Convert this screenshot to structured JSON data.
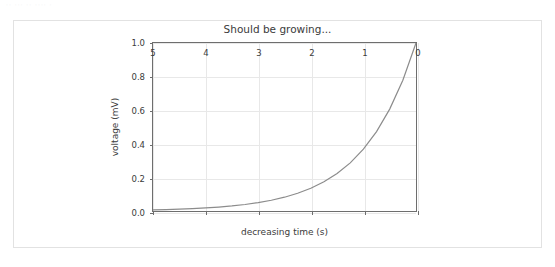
{
  "top_artifact": {
    "ghost_text": "··  ···  ·· ···· ·"
  },
  "card": {
    "border_color": "#e2e2e2",
    "background": "#ffffff"
  },
  "chart_data": {
    "type": "line",
    "title": "Should be growing...",
    "xlabel": "decreasing time (s)",
    "ylabel": "voltage (mV)",
    "xlim": [
      5,
      0
    ],
    "ylim": [
      0.0,
      1.0
    ],
    "x_inverted": true,
    "grid": true,
    "legend": null,
    "line_color": "#8c8c8c",
    "line_width": 1.2,
    "xticks": [
      5,
      4,
      3,
      2,
      1,
      0
    ],
    "xtick_labels": [
      "5",
      "4",
      "3",
      "2",
      "1",
      "0"
    ],
    "yticks": [
      0.0,
      0.2,
      0.4,
      0.6,
      0.8,
      1.0
    ],
    "ytick_labels": [
      "0.0",
      "0.2",
      "0.4",
      "0.6",
      "0.8",
      "1.0"
    ],
    "series": [
      {
        "name": "voltage",
        "x": [
          5.0,
          4.75,
          4.5,
          4.25,
          4.0,
          3.75,
          3.5,
          3.25,
          3.0,
          2.75,
          2.5,
          2.25,
          2.0,
          1.75,
          1.5,
          1.25,
          1.0,
          0.75,
          0.5,
          0.25,
          0.0
        ],
        "y": [
          0.0067,
          0.0087,
          0.0111,
          0.0143,
          0.0183,
          0.0235,
          0.0302,
          0.0388,
          0.0498,
          0.0639,
          0.0821,
          0.1054,
          0.1353,
          0.1738,
          0.2231,
          0.2865,
          0.3679,
          0.4724,
          0.6065,
          0.7788,
          1.0
        ]
      }
    ]
  }
}
